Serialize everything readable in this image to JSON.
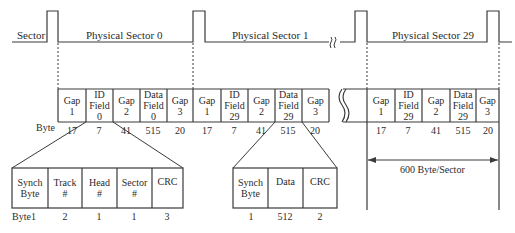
{
  "signal": {
    "label": "Sector",
    "sectors": [
      {
        "label": "Physical Sector 0"
      },
      {
        "label": "Physical Sector 1"
      },
      {
        "label": "Physical Sector 29"
      }
    ],
    "break_symbol": "≈"
  },
  "sector_row": {
    "byte_label": "Byte",
    "groups": [
      {
        "cells": [
          {
            "line1": "Gap",
            "line2": "1",
            "line3": "",
            "bytes": "17"
          },
          {
            "line1": "ID",
            "line2": "Field",
            "line3": "0",
            "bytes": "7"
          },
          {
            "line1": "Gap",
            "line2": "2",
            "line3": "",
            "bytes": "41"
          },
          {
            "line1": "Data",
            "line2": "Field",
            "line3": "0",
            "bytes": "515"
          },
          {
            "line1": "Gap",
            "line2": "3",
            "line3": "",
            "bytes": "20"
          }
        ]
      },
      {
        "cells": [
          {
            "line1": "Gap",
            "line2": "1",
            "line3": "",
            "bytes": "17"
          },
          {
            "line1": "ID",
            "line2": "Field",
            "line3": "29",
            "bytes": "7"
          },
          {
            "line1": "Gap",
            "line2": "2",
            "line3": "",
            "bytes": "41"
          },
          {
            "line1": "Data",
            "line2": "Field",
            "line3": "29",
            "bytes": "515"
          },
          {
            "line1": "Gap",
            "line2": "3",
            "line3": "",
            "bytes": "20"
          }
        ]
      },
      {
        "cells": [
          {
            "line1": "Gap",
            "line2": "1",
            "line3": "",
            "bytes": "17"
          },
          {
            "line1": "ID",
            "line2": "Field",
            "line3": "29",
            "bytes": "7"
          },
          {
            "line1": "Gap",
            "line2": "2",
            "line3": "",
            "bytes": "41"
          },
          {
            "line1": "Data",
            "line2": "Field",
            "line3": "29",
            "bytes": "515"
          },
          {
            "line1": "Gap",
            "line2": "3",
            "line3": "",
            "bytes": "20"
          }
        ]
      }
    ],
    "sector_size_label": "600 Byte/Sector"
  },
  "id_field_detail": {
    "byte_label": "Byte1",
    "cells": [
      {
        "line1": "Synch",
        "line2": "Byte",
        "bytes": "1"
      },
      {
        "line1": "Track",
        "line2": "#",
        "bytes": "2"
      },
      {
        "line1": "Head",
        "line2": "#",
        "bytes": "1"
      },
      {
        "line1": "Sector",
        "line2": "#",
        "bytes": "1"
      },
      {
        "line1": "CRC",
        "line2": "",
        "bytes": "3"
      }
    ]
  },
  "data_field_detail": {
    "cells": [
      {
        "line1": "Synch",
        "line2": "Byte",
        "bytes": "1"
      },
      {
        "line1": "Data",
        "line2": "",
        "bytes": "512"
      },
      {
        "line1": "CRC",
        "line2": "",
        "bytes": "2"
      }
    ]
  },
  "colors": {
    "line": "#3a3a3a",
    "text": "#2b2b2b",
    "background": "#ffffff"
  }
}
